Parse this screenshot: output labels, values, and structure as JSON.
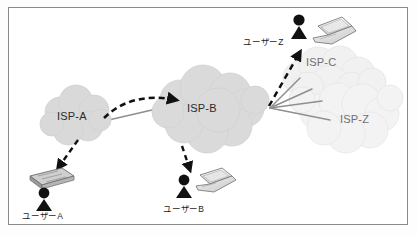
{
  "diagram": {
    "background_color": "#ffffff",
    "border_color": "#8a8a8a",
    "cloud_color_dark": "#d8d8d8",
    "cloud_color_light": "#f0f0f0",
    "link_color": "#8f8f8f",
    "arrow_color": "#111111"
  },
  "clouds": [
    {
      "id": "isp-a",
      "label": "ISP-A",
      "shade": "dark",
      "cx": 76,
      "cy": 116
    },
    {
      "id": "isp-b",
      "label": "ISP-B",
      "shade": "dark",
      "cx": 207,
      "cy": 108
    },
    {
      "id": "isp-c",
      "label": "ISP-C",
      "shade": "light",
      "cx": 325,
      "cy": 62
    },
    {
      "id": "isp-z",
      "label": "ISP-Z",
      "shade": "light",
      "cx": 355,
      "cy": 120
    }
  ],
  "users": [
    {
      "id": "user-a",
      "label": "ユーザーA",
      "device": "document-icon",
      "x": 45,
      "y": 210
    },
    {
      "id": "user-b",
      "label": "ユーザーB",
      "device": "laptop-icon",
      "x": 186,
      "y": 213
    },
    {
      "id": "user-z",
      "label": "ユーザーZ",
      "device": "laptop-icon",
      "x": 268,
      "y": 45
    }
  ],
  "links": [
    {
      "id": "link-a-b",
      "from": "isp-a",
      "to": "isp-b",
      "style": "solid"
    },
    {
      "id": "link-b-fan-1",
      "from": "junction",
      "to": "isp-c",
      "style": "solid"
    },
    {
      "id": "link-b-fan-2",
      "from": "junction",
      "to": "isp-c",
      "style": "solid"
    },
    {
      "id": "link-b-fan-3",
      "from": "junction",
      "to": "isp-z",
      "style": "solid"
    },
    {
      "id": "link-b-fan-4",
      "from": "junction",
      "to": "isp-z",
      "style": "solid"
    }
  ],
  "flows": [
    {
      "id": "flow-a-to-b",
      "from": "isp-a",
      "to": "isp-b",
      "style": "dashed-curved"
    },
    {
      "id": "flow-a-to-user-a",
      "from": "isp-a",
      "to": "user-a",
      "style": "dashed"
    },
    {
      "id": "flow-b-to-user-b",
      "from": "isp-b",
      "to": "user-b",
      "style": "dashed"
    },
    {
      "id": "flow-b-to-user-z",
      "from": "junction",
      "to": "user-z",
      "style": "dashed"
    }
  ]
}
